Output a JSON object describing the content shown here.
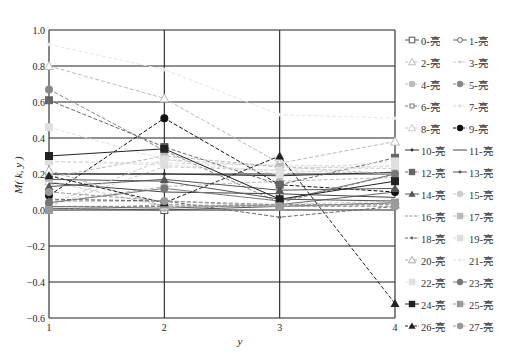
{
  "chart_data": {
    "type": "line",
    "title": "",
    "xlabel": "y",
    "ylabel": "M( k, y )",
    "x": [
      1,
      2,
      3,
      4
    ],
    "xticks": [
      "1",
      "2",
      "3",
      "4"
    ],
    "yticks": [
      "1.0",
      "0.8",
      "0.6",
      "0.4",
      "0.2",
      "0.0",
      "-0.2",
      "-0.4",
      "-0.6"
    ],
    "ylim": [
      -0.6,
      1.0
    ],
    "grid": true,
    "legend_position": "right",
    "series": [
      {
        "name": "0-亮",
        "marker": "square-open",
        "dash": "solid",
        "color": "#555555",
        "values": [
          0.01,
          0.0,
          0.02,
          0.04
        ]
      },
      {
        "name": "1-亮",
        "marker": "diamond-open",
        "dash": "solid",
        "color": "#666666",
        "values": [
          0.02,
          0.01,
          0.03,
          0.1
        ]
      },
      {
        "name": "2-亮",
        "marker": "triangle-open",
        "dash": "dashed",
        "color": "#bbbbbb",
        "values": [
          0.8,
          0.62,
          0.26,
          0.38
        ]
      },
      {
        "name": "3-亮",
        "marker": "dot",
        "dash": "dashed",
        "color": "#cccccc",
        "values": [
          0.02,
          0.24,
          0.22,
          0.2
        ]
      },
      {
        "name": "4-亮",
        "marker": "circle",
        "dash": "dashed",
        "color": "#bbbbbb",
        "values": [
          0.04,
          0.13,
          0.16,
          0.18
        ]
      },
      {
        "name": "5-亮",
        "marker": "circle",
        "dash": "dashed",
        "color": "#888888",
        "values": [
          0.67,
          0.33,
          0.04,
          0.2
        ]
      },
      {
        "name": "6-亮",
        "marker": "square-small",
        "dash": "dashed",
        "color": "#777777",
        "values": [
          0.02,
          0.02,
          0.03,
          0.03
        ]
      },
      {
        "name": "7-亮",
        "marker": "dot",
        "dash": "dashed",
        "color": "#dddddd",
        "values": [
          0.27,
          0.26,
          0.25,
          0.24
        ]
      },
      {
        "name": "8-亮",
        "marker": "triangle-open",
        "dash": "dashed",
        "color": "#cccccc",
        "values": [
          0.16,
          0.02,
          0.03,
          0.05
        ]
      },
      {
        "name": "9-亮",
        "marker": "circle",
        "dash": "dashed",
        "color": "#111111",
        "values": [
          0.08,
          0.51,
          0.14,
          0.1
        ]
      },
      {
        "name": "10-亮",
        "marker": "dot",
        "dash": "solid",
        "color": "#333333",
        "values": [
          0.2,
          0.2,
          0.19,
          0.21
        ]
      },
      {
        "name": "11-亮",
        "marker": "none",
        "dash": "solid",
        "color": "#444444",
        "values": [
          0.15,
          0.1,
          0.09,
          0.07
        ]
      },
      {
        "name": "12-亮",
        "marker": "square",
        "dash": "dashed",
        "color": "#666666",
        "values": [
          0.61,
          0.35,
          0.14,
          0.29
        ]
      },
      {
        "name": "13-亮",
        "marker": "dot",
        "dash": "solid",
        "color": "#555555",
        "values": [
          0.17,
          0.16,
          0.06,
          0.05
        ]
      },
      {
        "name": "14-亮",
        "marker": "triangle",
        "dash": "solid",
        "color": "#555555",
        "values": [
          0.13,
          0.17,
          0.11,
          0.12
        ]
      },
      {
        "name": "15-亮",
        "marker": "circle",
        "dash": "dashed",
        "color": "#cccccc",
        "values": [
          0.03,
          0.28,
          0.24,
          0.23
        ]
      },
      {
        "name": "16-亮",
        "marker": "none",
        "dash": "dashed",
        "color": "#999999",
        "values": [
          0.05,
          0.05,
          0.03,
          0.03
        ]
      },
      {
        "name": "17-亮",
        "marker": "square",
        "dash": "dashed",
        "color": "#bbbbbb",
        "values": [
          0.18,
          0.3,
          0.24,
          0.2
        ]
      },
      {
        "name": "18-亮",
        "marker": "dot",
        "dash": "dashed",
        "color": "#666666",
        "values": [
          0.06,
          0.05,
          -0.04,
          0.02
        ]
      },
      {
        "name": "19-亮",
        "marker": "square",
        "dash": "dashed",
        "color": "#dddddd",
        "values": [
          0.27,
          0.25,
          0.22,
          0.27
        ]
      },
      {
        "name": "20-亮",
        "marker": "triangle-open",
        "dash": "dashed",
        "color": "#aaaaaa",
        "values": [
          0.22,
          0.02,
          0.02,
          0.03
        ]
      },
      {
        "name": "21-亮",
        "marker": "dot",
        "dash": "dashed",
        "color": "#e6e6e6",
        "values": [
          0.92,
          0.78,
          0.53,
          0.51
        ]
      },
      {
        "name": "22-亮",
        "marker": "square",
        "dash": "dashed",
        "color": "#e0e0e0",
        "values": [
          0.46,
          0.28,
          0.2,
          0.25
        ]
      },
      {
        "name": "23-亮",
        "marker": "circle",
        "dash": "solid",
        "color": "#777777",
        "values": [
          0.04,
          0.12,
          0.05,
          0.2
        ]
      },
      {
        "name": "24-亮",
        "marker": "square",
        "dash": "solid",
        "color": "#222222",
        "values": [
          0.3,
          0.34,
          0.06,
          0.16
        ]
      },
      {
        "name": "25-亮",
        "marker": "square",
        "dash": "dashed",
        "color": "#999999",
        "values": [
          0.0,
          0.03,
          0.02,
          0.04
        ]
      },
      {
        "name": "26-亮",
        "marker": "triangle",
        "dash": "dashed",
        "color": "#222222",
        "values": [
          0.19,
          0.04,
          0.3,
          -0.52
        ]
      },
      {
        "name": "27-亮",
        "marker": "circle",
        "dash": "dashed",
        "color": "#999999",
        "values": [
          0.1,
          0.05,
          0.02,
          0.02
        ]
      }
    ]
  }
}
